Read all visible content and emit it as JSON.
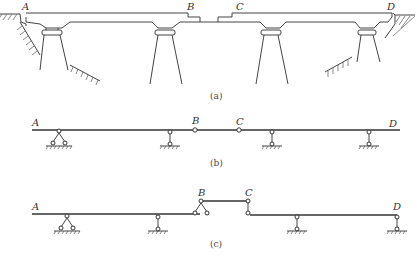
{
  "figure": {
    "panel_a": {
      "caption": "(a)",
      "description": "Elevation of a multi-span bridge with cantilevered girders and a suspended span",
      "labels": {
        "A": "A",
        "B": "B",
        "C": "C",
        "D": "D"
      },
      "piers": 4,
      "abutments": 2
    },
    "panel_b": {
      "caption": "(b)",
      "description": "Computational model: continuous beam with hinges at B and C",
      "labels": {
        "A": "A",
        "B": "B",
        "C": "C",
        "D": "D"
      },
      "supports": [
        "fixed-hinge",
        "roller",
        "roller",
        "roller"
      ],
      "hinges": [
        "B",
        "C"
      ]
    },
    "panel_c": {
      "caption": "(c)",
      "description": "Hierarchy diagram: suspended span BC resting on cantilever beams",
      "labels": {
        "A": "A",
        "B": "B",
        "C": "C",
        "D": "D"
      },
      "supports": [
        "fixed-hinge",
        "roller",
        "roller",
        "roller"
      ]
    }
  },
  "colors": {
    "line": "#333333",
    "background": "#ffffff"
  }
}
